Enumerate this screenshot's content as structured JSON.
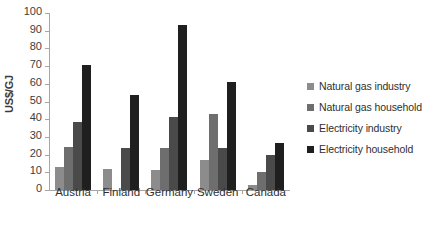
{
  "chart_data": {
    "type": "bar",
    "title": "",
    "subtitle": "",
    "xlabel": "",
    "ylabel": "US$/GJ",
    "ylim": [
      0,
      100
    ],
    "ytick_step": 10,
    "yticks": [
      0,
      10,
      20,
      30,
      40,
      50,
      60,
      70,
      80,
      90,
      100
    ],
    "ytick_labels": [
      "0",
      "10",
      "20",
      "30",
      "40",
      "50",
      "60",
      "70",
      "80",
      "90",
      "100"
    ],
    "grid": false,
    "legend_position": "right",
    "categories": [
      "Austria",
      "Finland",
      "Germany",
      "Sweden",
      "Canada"
    ],
    "series": [
      {
        "name": "Natural gas industry",
        "color": "#8c8c8c",
        "values": [
          13,
          12,
          11.5,
          17,
          3
        ]
      },
      {
        "name": "Natural gas household",
        "color": "#6e6e6e",
        "values": [
          24.5,
          0,
          24,
          43,
          10
        ]
      },
      {
        "name": "Electricity industry",
        "color": "#4a4a4a",
        "values": [
          38.5,
          24,
          41,
          24,
          20
        ]
      },
      {
        "name": "Electricity household",
        "color": "#1f1f1f",
        "values": [
          70.5,
          53.5,
          93.5,
          61,
          26.5
        ]
      }
    ]
  },
  "legend": {
    "items": [
      {
        "label": "Natural gas industry"
      },
      {
        "label": "Natural gas household"
      },
      {
        "label": "Electricity industry"
      },
      {
        "label": "Electricity household"
      }
    ]
  },
  "axes": {
    "y_title": "US$/GJ"
  }
}
